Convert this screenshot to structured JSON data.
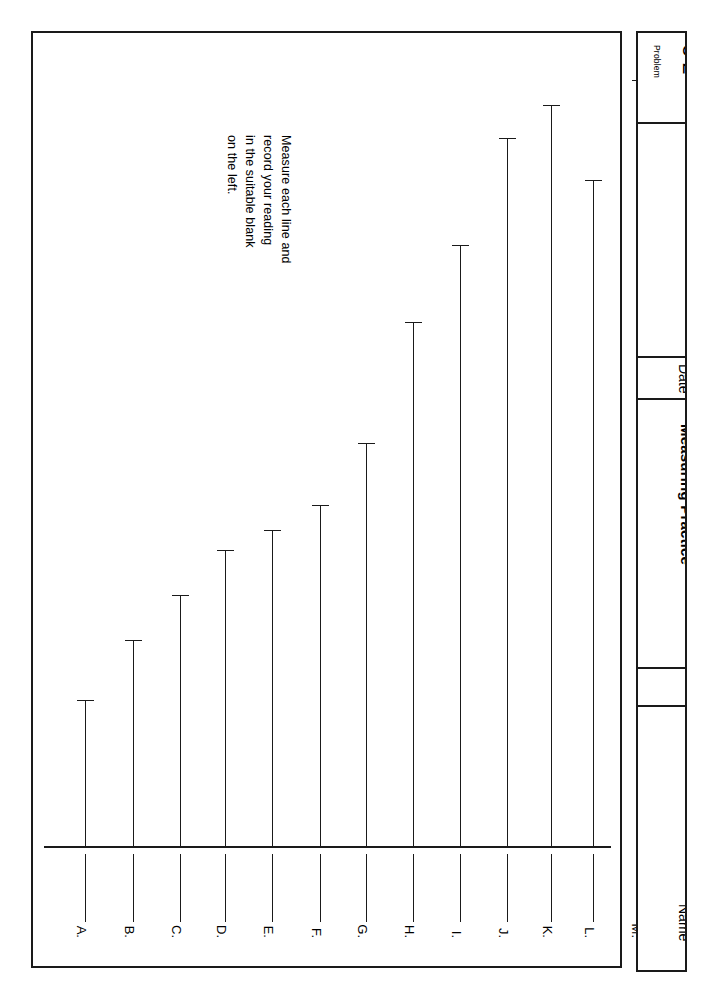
{
  "worksheet": {
    "instructions": [
      "Measure each line and",
      "record your reading",
      "in the suitable blank",
      "on the left."
    ],
    "ink_color": "#1a1a1a",
    "paper_color": "#ffffff"
  },
  "title_strip": {
    "problem_kicker": "Problem",
    "problem_number": "5-2",
    "date_label": "Date",
    "subject_label": "Measuring Practice",
    "name_label": "Name"
  },
  "answer_blanks": [
    {
      "label": "A."
    },
    {
      "label": "B."
    },
    {
      "label": "C."
    },
    {
      "label": "D."
    },
    {
      "label": "E."
    },
    {
      "label": "F."
    },
    {
      "label": "G."
    },
    {
      "label": "H."
    },
    {
      "label": "I."
    },
    {
      "label": "J."
    },
    {
      "label": "K."
    },
    {
      "label": "L."
    },
    {
      "label": "M."
    }
  ],
  "chart_data": {
    "type": "bar",
    "title": "Measuring Practice",
    "xlabel": "",
    "ylabel": "",
    "grid": false,
    "legend": null,
    "orientation": "vertical",
    "note": "Vertical measurement lines of differing lengths, each capped with a short horizontal tick at its top end; students measure each and record the reading in the lettered blank below.",
    "categories": [
      "A.",
      "B.",
      "C.",
      "D.",
      "E.",
      "F.",
      "G.",
      "H.",
      "I.",
      "J.",
      "K.",
      "L.",
      "M."
    ],
    "values": [
      145,
      205,
      250,
      295,
      315,
      340,
      402,
      523,
      600,
      707,
      740,
      665,
      765
    ],
    "value_unit": "px",
    "ylim": [
      0,
      813
    ],
    "x_positions": [
      52,
      100,
      147,
      192,
      239,
      287,
      333,
      380,
      427,
      474,
      518,
      560,
      607
    ]
  }
}
